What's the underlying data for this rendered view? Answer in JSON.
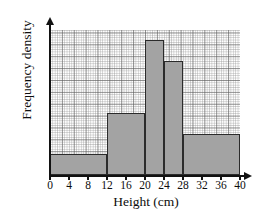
{
  "chart_data": {
    "type": "bar",
    "title": "",
    "subtitle": "",
    "xlabel": "Height (cm)",
    "ylabel": "Frequency density",
    "xlim": [
      0,
      40
    ],
    "ylim": [
      0,
      7
    ],
    "grid": true,
    "grid_style": "graph-paper, minor squares with heavier line every 5th",
    "legend": "none",
    "axis_arrows": true,
    "y_tick_labels": [],
    "x_tick_labels": [
      "0",
      "4",
      "8",
      "12",
      "16",
      "20",
      "24",
      "28",
      "32",
      "36",
      "40"
    ],
    "x_ticks": [
      0,
      4,
      8,
      12,
      16,
      20,
      24,
      28,
      32,
      36,
      40
    ],
    "bar_fill_color": "#a3a3a3",
    "bar_edge_color": "#2b2b2b",
    "axis_color": "#121212",
    "categories": [
      "0-12",
      "12-20",
      "20-24",
      "24-28",
      "28-40"
    ],
    "bins": [
      {
        "label": "0-12",
        "start": 0,
        "end": 12,
        "value": 1
      },
      {
        "label": "12-20",
        "start": 12,
        "end": 20,
        "value": 3
      },
      {
        "label": "20-24",
        "start": 20,
        "end": 24,
        "value": 6.5
      },
      {
        "label": "24-28",
        "start": 24,
        "end": 28,
        "value": 5.5
      },
      {
        "label": "28-40",
        "start": 28,
        "end": 40,
        "value": 2
      }
    ],
    "values": [
      1,
      3,
      6.5,
      5.5,
      2
    ]
  }
}
